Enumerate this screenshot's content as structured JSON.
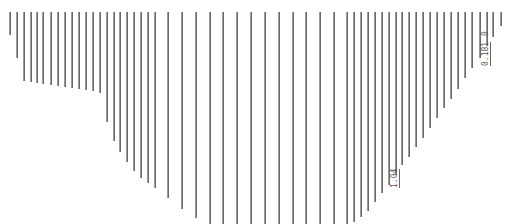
{
  "diagram": {
    "type": "ordinate-line profile",
    "line_color": "#6b6b6b",
    "top_y": 12,
    "ordinates": [
      {
        "x": 9,
        "end_y": 35
      },
      {
        "x": 16,
        "end_y": 58
      },
      {
        "x": 23,
        "end_y": 81
      },
      {
        "x": 30,
        "end_y": 82
      },
      {
        "x": 36,
        "end_y": 83
      },
      {
        "x": 42,
        "end_y": 84
      },
      {
        "x": 50,
        "end_y": 85
      },
      {
        "x": 57,
        "end_y": 86
      },
      {
        "x": 64,
        "end_y": 87
      },
      {
        "x": 71,
        "end_y": 88
      },
      {
        "x": 78,
        "end_y": 89
      },
      {
        "x": 85,
        "end_y": 90
      },
      {
        "x": 92,
        "end_y": 91
      },
      {
        "x": 99,
        "end_y": 93
      },
      {
        "x": 106,
        "end_y": 122
      },
      {
        "x": 113,
        "end_y": 141
      },
      {
        "x": 119,
        "end_y": 152
      },
      {
        "x": 126,
        "end_y": 162
      },
      {
        "x": 133,
        "end_y": 171
      },
      {
        "x": 140,
        "end_y": 178
      },
      {
        "x": 147,
        "end_y": 183
      },
      {
        "x": 154,
        "end_y": 188
      },
      {
        "x": 167,
        "end_y": 198
      },
      {
        "x": 181,
        "end_y": 209
      },
      {
        "x": 195,
        "end_y": 218
      },
      {
        "x": 209,
        "end_y": 224
      },
      {
        "x": 222,
        "end_y": 224
      },
      {
        "x": 236,
        "end_y": 224
      },
      {
        "x": 250,
        "end_y": 224
      },
      {
        "x": 264,
        "end_y": 224
      },
      {
        "x": 278,
        "end_y": 224
      },
      {
        "x": 292,
        "end_y": 224
      },
      {
        "x": 305,
        "end_y": 224
      },
      {
        "x": 319,
        "end_y": 224
      },
      {
        "x": 333,
        "end_y": 224
      },
      {
        "x": 346,
        "end_y": 224
      },
      {
        "x": 353,
        "end_y": 222
      },
      {
        "x": 360,
        "end_y": 217
      },
      {
        "x": 367,
        "end_y": 211
      },
      {
        "x": 374,
        "end_y": 202
      },
      {
        "x": 381,
        "end_y": 193
      },
      {
        "x": 388,
        "end_y": 185
      },
      {
        "x": 395,
        "end_y": 175
      },
      {
        "x": 401,
        "end_y": 165
      },
      {
        "x": 408,
        "end_y": 157
      },
      {
        "x": 415,
        "end_y": 147
      },
      {
        "x": 422,
        "end_y": 138
      },
      {
        "x": 429,
        "end_y": 128
      },
      {
        "x": 436,
        "end_y": 118
      },
      {
        "x": 443,
        "end_y": 108
      },
      {
        "x": 450,
        "end_y": 99
      },
      {
        "x": 457,
        "end_y": 89
      },
      {
        "x": 464,
        "end_y": 78
      },
      {
        "x": 471,
        "end_y": 68
      },
      {
        "x": 479,
        "end_y": 58
      },
      {
        "x": 486,
        "end_y": 46
      },
      {
        "x": 492,
        "end_y": 37
      },
      {
        "x": 500,
        "end_y": 26
      }
    ],
    "labels": [
      {
        "text": "1.04",
        "x": 391,
        "y": 188,
        "boxed": true
      },
      {
        "text": "0.181",
        "x": 482,
        "y": 66,
        "boxed": true
      },
      {
        "text": "0",
        "x": 482,
        "y": 36,
        "boxed": false
      }
    ]
  }
}
